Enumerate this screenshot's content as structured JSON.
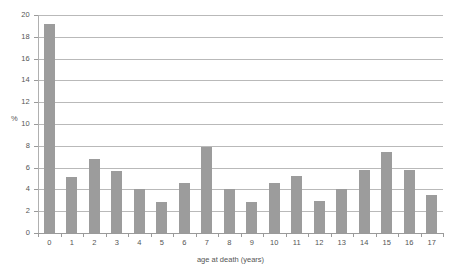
{
  "chart_data": {
    "type": "bar",
    "title": "",
    "subtitle": "",
    "xlabel": "age at death (years)",
    "ylabel": "%",
    "categories": [
      "0",
      "1",
      "2",
      "3",
      "4",
      "5",
      "6",
      "7",
      "8",
      "9",
      "10",
      "11",
      "12",
      "13",
      "14",
      "15",
      "16",
      "17"
    ],
    "values": [
      19.2,
      5.1,
      6.8,
      5.7,
      4.0,
      2.8,
      4.6,
      7.9,
      4.0,
      2.8,
      4.6,
      5.2,
      2.9,
      4.0,
      5.8,
      7.4,
      5.8,
      3.5
    ],
    "series": [
      {
        "name": "percent of deaths",
        "values": [
          19.2,
          5.1,
          6.8,
          5.7,
          4.0,
          2.8,
          4.6,
          7.9,
          4.0,
          2.8,
          4.6,
          5.2,
          2.9,
          4.0,
          5.8,
          7.4,
          5.8,
          3.5
        ]
      }
    ],
    "ylim": [
      0,
      20
    ],
    "ytick_step": 2,
    "yticks": [
      "0",
      "2",
      "4",
      "6",
      "8",
      "10",
      "12",
      "14",
      "16",
      "18",
      "20"
    ],
    "xlim": [
      -0.5,
      17.5
    ],
    "grid": "horizontal",
    "legend": "none",
    "bar_color": "#9c9c9c",
    "gridline_color": "#b9b9b9",
    "axis_color": "#9a9a9a",
    "text_color": "#555555"
  },
  "axes": {
    "y_title": "%",
    "x_title": "age at death (years)"
  }
}
